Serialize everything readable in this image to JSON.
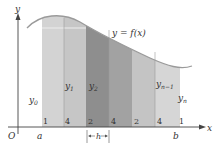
{
  "diagram": {
    "curve_label": "y = f(x)",
    "axis": {
      "x_label": "x",
      "y_label": "y",
      "origin": "O"
    },
    "endpoints": {
      "a": "a",
      "b": "b"
    },
    "ordinates": [
      "y0",
      "y1",
      "y2",
      "yn-1",
      "yn"
    ],
    "ordinate_display": {
      "y0": {
        "base": "y",
        "sub": "0"
      },
      "y1": {
        "base": "y",
        "sub": "1"
      },
      "y2": {
        "base": "y",
        "sub": "2"
      },
      "yn1": {
        "base": "y",
        "sub": "n−1"
      },
      "yn": {
        "base": "y",
        "sub": "n"
      }
    },
    "weights": [
      "1",
      "4",
      "2",
      "4",
      "2",
      "4",
      "1"
    ],
    "step_label": "h",
    "colors": {
      "strip_light": "#cfcfcf",
      "strip_mid": "#b9b9b9",
      "strip_dark": "#8f8f8f",
      "strip_dark2": "#a3a3a3",
      "curve": "#9a9a9a",
      "axis": "#444444"
    }
  }
}
